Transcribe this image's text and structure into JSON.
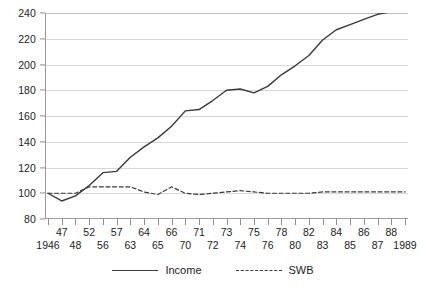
{
  "chart_data": {
    "type": "line",
    "title": "",
    "subtitle": "",
    "xlabel": "",
    "ylabel": "",
    "ylim": [
      80,
      240
    ],
    "ytick_step": 20,
    "yticks": [
      80,
      100,
      120,
      140,
      160,
      180,
      200,
      220,
      240
    ],
    "grid": true,
    "legend_position": "bottom-center",
    "categories": [
      "1946",
      "47",
      "48",
      "52",
      "56",
      "57",
      "63",
      "64",
      "65",
      "66",
      "70",
      "71",
      "72",
      "73",
      "74",
      "75",
      "76",
      "78",
      "80",
      "82",
      "83",
      "84",
      "85",
      "86",
      "87",
      "88",
      "1989"
    ],
    "category_label_rows": [
      "bottom",
      "top",
      "bottom",
      "top",
      "bottom",
      "top",
      "bottom",
      "top",
      "bottom",
      "top",
      "bottom",
      "top",
      "bottom",
      "top",
      "bottom",
      "top",
      "bottom",
      "top",
      "bottom",
      "top",
      "bottom",
      "top",
      "bottom",
      "top",
      "bottom",
      "top",
      "bottom"
    ],
    "series": [
      {
        "name": "Income",
        "style": "solid",
        "color": "#3a3a3a",
        "values": [
          100,
          94,
          98,
          106,
          116,
          117,
          128,
          136,
          143,
          152,
          164,
          165,
          172,
          180,
          181,
          178,
          183,
          192,
          199,
          207,
          219,
          227,
          231,
          235,
          239,
          241,
          241
        ]
      },
      {
        "name": "SWB",
        "style": "dashed",
        "color": "#3a3a3a",
        "values": [
          100,
          100,
          100,
          105,
          105,
          105,
          105,
          101,
          99,
          105,
          100,
          99,
          100,
          101,
          102,
          101,
          100,
          100,
          100,
          100,
          101,
          101,
          101,
          101,
          101,
          101,
          101
        ]
      }
    ]
  },
  "legend": {
    "entries": [
      {
        "label": "Income",
        "icon": "solid-line-icon"
      },
      {
        "label": "SWB",
        "icon": "dashed-line-icon"
      }
    ]
  }
}
